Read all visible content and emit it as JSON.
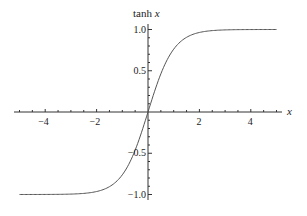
{
  "chart_data": {
    "type": "line",
    "title": "",
    "xlabel": "x",
    "ylabel": "tanh x",
    "xlim": [
      -5,
      5
    ],
    "ylim": [
      -1.0,
      1.0
    ],
    "grid": false,
    "legend": null,
    "x_ticks": [
      -4,
      -2,
      2,
      4
    ],
    "x_tick_labels": [
      "−4",
      "−2",
      "2",
      "4"
    ],
    "y_ticks": [
      1.0,
      0.5,
      -0.5,
      -1.0
    ],
    "y_tick_labels": [
      "1.0",
      "0.5",
      "−0.5",
      "−1.0"
    ],
    "series": [
      {
        "name": "tanh x",
        "color": "#555555",
        "x": [
          -5,
          -4,
          -3,
          -2.5,
          -2,
          -1.5,
          -1,
          -0.5,
          0,
          0.5,
          1,
          1.5,
          2,
          2.5,
          3,
          4,
          5
        ],
        "y": [
          -0.9999,
          -0.9993,
          -0.9951,
          -0.9866,
          -0.964,
          -0.9051,
          -0.7616,
          -0.4621,
          0,
          0.4621,
          0.7616,
          0.9051,
          0.964,
          0.9866,
          0.9951,
          0.9993,
          0.9999
        ]
      }
    ]
  },
  "labels": {
    "y_axis_title_fn": "tanh",
    "y_axis_title_var": "x",
    "x_axis_title": "x"
  }
}
